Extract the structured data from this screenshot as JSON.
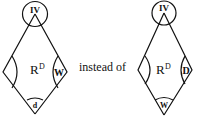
{
  "diagrams": [
    {
      "name": "left-diamond",
      "top_circle_label": "IV",
      "center_label_base": "R",
      "center_label_sup": "D",
      "left_angle_label": "",
      "right_angle_label": "W",
      "bottom_angle_label": "d"
    },
    {
      "name": "right-diamond",
      "top_circle_label": "IV",
      "center_label_base": "R",
      "center_label_sup": "D",
      "left_angle_label": "",
      "right_angle_label": "D",
      "bottom_angle_label": "W"
    }
  ],
  "connector_text": "instead of",
  "colors": {
    "ink": "#111111",
    "background": "#ffffff"
  }
}
